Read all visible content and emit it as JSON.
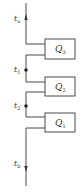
{
  "diagram": {
    "type": "heat-flow-series",
    "colors": {
      "line": "#4a4a4a",
      "text": "#333333",
      "background": "#ffffff"
    },
    "temperatures": [
      {
        "id": "ta",
        "symbol": "t",
        "subscript": "a"
      },
      {
        "id": "t1",
        "symbol": "t",
        "subscript": "1"
      },
      {
        "id": "t2",
        "symbol": "t",
        "subscript": "2"
      },
      {
        "id": "tb",
        "symbol": "t",
        "subscript": "b"
      }
    ],
    "boxes": [
      {
        "id": "Q3",
        "symbol": "Q",
        "subscript": "3"
      },
      {
        "id": "Q2",
        "symbol": "Q",
        "subscript": "2"
      },
      {
        "id": "Q1",
        "symbol": "Q",
        "subscript": "1"
      }
    ]
  }
}
